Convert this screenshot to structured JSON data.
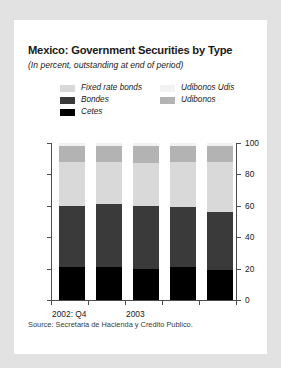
{
  "card": {
    "title": "Mexico: Government Securities by Type",
    "subtitle": "(In percent, outstanding at end of period)",
    "source": "Source: Secretaria de Hacienda y Credito Publico."
  },
  "legend": {
    "entries": [
      {
        "label": "Fixed rate bonds",
        "color": "#d9d9d9"
      },
      {
        "label": "Udibonos Udis",
        "color": "#f2f2f2"
      },
      {
        "label": "Bondes",
        "color": "#3a3a3a"
      },
      {
        "label": "Udibonos",
        "color": "#b3b3b3"
      },
      {
        "label": "Cetes",
        "color": "#000000"
      }
    ]
  },
  "chart_data": {
    "type": "bar",
    "stacked": true,
    "title": "Mexico: Government Securities by Type",
    "subtitle": "(In percent, outstanding at end of period)",
    "xlabel": "",
    "ylabel": "",
    "ylim": [
      0,
      100
    ],
    "yticks": [
      0,
      20,
      40,
      60,
      80,
      100
    ],
    "ytick_labels": [
      "0",
      "20",
      "40",
      "60",
      "80",
      "100"
    ],
    "grid": false,
    "legend_position": "top",
    "axis_labels": [
      {
        "text": "2002: Q4",
        "bar_index": 0
      },
      {
        "text": "2003",
        "bar_index": 2
      }
    ],
    "categories": [
      "2002: Q4",
      "2003 Q1",
      "2003 Q2",
      "2003 Q3",
      "2003 Q4"
    ],
    "series": [
      {
        "name": "Cetes",
        "color": "#000000",
        "values": [
          21,
          21,
          20,
          21,
          19
        ]
      },
      {
        "name": "Bondes",
        "color": "#3a3a3a",
        "values": [
          39,
          40,
          40,
          38,
          37
        ]
      },
      {
        "name": "Fixed rate bonds",
        "color": "#d9d9d9",
        "values": [
          28,
          27,
          27,
          29,
          32
        ]
      },
      {
        "name": "Udibonos",
        "color": "#b3b3b3",
        "values": [
          10,
          10,
          11,
          10,
          10
        ]
      },
      {
        "name": "Udibonos Udis",
        "color": "#f2f2f2",
        "values": [
          2,
          2,
          2,
          2,
          2
        ]
      }
    ]
  }
}
